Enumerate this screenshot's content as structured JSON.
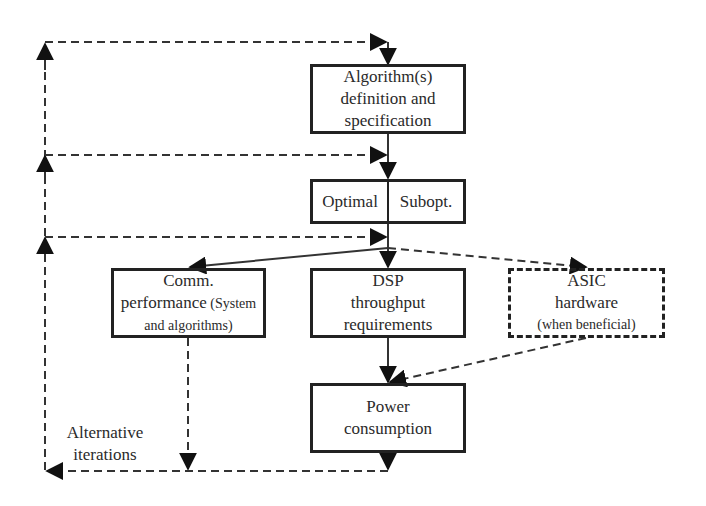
{
  "diagram": {
    "nodes": {
      "algorithm": {
        "lines": [
          "Algorithm(s)",
          "definition and",
          "specification"
        ]
      },
      "choice": {
        "left": "Optimal",
        "right": "Subopt."
      },
      "comm": {
        "line1": "Comm.",
        "line2_main": "performance",
        "line2_small": " (System",
        "line3": "and algorithms)"
      },
      "dsp": {
        "lines": [
          "DSP",
          "throughput",
          "requirements"
        ]
      },
      "asic": {
        "line1": "ASIC",
        "line2": "hardware",
        "line3": "(when beneficial)"
      },
      "power": {
        "lines": [
          "Power",
          "consumption"
        ]
      }
    },
    "feedback_label": {
      "lines": [
        "Alternative",
        "iterations"
      ]
    },
    "edges": [
      {
        "from": "algorithm",
        "to": "choice",
        "style": "solid"
      },
      {
        "from": "choice",
        "to": "comm",
        "style": "solid"
      },
      {
        "from": "choice",
        "to": "dsp",
        "style": "solid"
      },
      {
        "from": "choice",
        "to": "asic",
        "style": "dashed"
      },
      {
        "from": "dsp",
        "to": "power",
        "style": "solid"
      },
      {
        "from": "asic",
        "to": "power",
        "style": "dashed"
      },
      {
        "from": "comm",
        "to": "iterations",
        "style": "dashed"
      },
      {
        "from": "power",
        "to": "iterations",
        "style": "dashed"
      },
      {
        "from": "iterations",
        "to": "algorithm",
        "style": "dashed"
      },
      {
        "from": "iterations",
        "to": "choice",
        "style": "dashed"
      },
      {
        "from": "iterations",
        "to": "dsp-stage",
        "style": "dashed"
      }
    ],
    "colors": {
      "stroke": "#222222",
      "text": "#2a2a2a",
      "background": "#ffffff"
    }
  }
}
